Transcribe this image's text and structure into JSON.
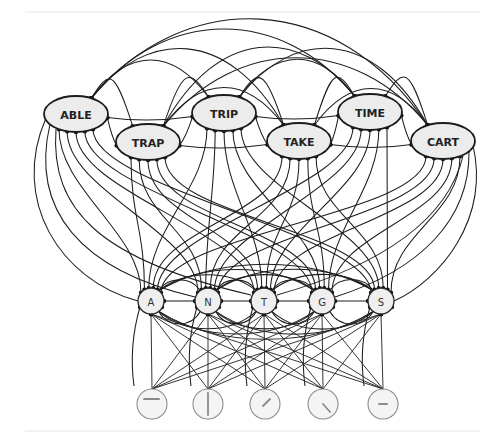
{
  "diagram": {
    "type": "interactive-activation-network",
    "layers": {
      "word": {
        "nodes": [
          {
            "id": "ABLE",
            "label": "ABLE",
            "cx": 76,
            "cy": 114
          },
          {
            "id": "TRAP",
            "label": "TRAP",
            "cx": 148,
            "cy": 142
          },
          {
            "id": "TRIP",
            "label": "TRIP",
            "cx": 224,
            "cy": 113
          },
          {
            "id": "TAKE",
            "label": "TAKE",
            "cx": 299,
            "cy": 141
          },
          {
            "id": "TIME",
            "label": "TIME",
            "cx": 370,
            "cy": 112
          },
          {
            "id": "CART",
            "label": "CART",
            "cx": 443,
            "cy": 141
          }
        ]
      },
      "letter": {
        "nodes": [
          {
            "id": "A",
            "label": "A",
            "cx": 151,
            "cy": 301
          },
          {
            "id": "N",
            "label": "N",
            "cx": 208,
            "cy": 301
          },
          {
            "id": "T",
            "label": "T",
            "cx": 264,
            "cy": 301
          },
          {
            "id": "G",
            "label": "G",
            "cx": 322,
            "cy": 301
          },
          {
            "id": "S",
            "label": "S",
            "cx": 381,
            "cy": 301
          }
        ]
      },
      "feature": {
        "nodes": [
          {
            "id": "horizontal-top",
            "glyph": "horizontal bar (upper)",
            "cx": 152,
            "cy": 404
          },
          {
            "id": "vertical",
            "glyph": "vertical bar",
            "cx": 208,
            "cy": 404
          },
          {
            "id": "diagonal-right",
            "glyph": "diagonal bar (up-right)",
            "cx": 265,
            "cy": 404
          },
          {
            "id": "diagonal-left",
            "glyph": "diagonal bar (down-right)",
            "cx": 323,
            "cy": 404
          },
          {
            "id": "horizontal-mid",
            "glyph": "horizontal bar (middle)",
            "cx": 383,
            "cy": 404
          }
        ]
      }
    },
    "connections": {
      "word_to_word": "mutual inhibitory arcs among all word nodes (dot terminals)",
      "letter_to_word": "excitatory/inhibitory arrows between every letter node and every word node",
      "letter_to_letter": "mutual arcs among letter nodes",
      "feature_to_letter": "straight lines from every feature node to every letter node"
    },
    "colors": {
      "edge": "#1e1e1e",
      "node_fill": "#ececec",
      "node_stroke": "#1c1c1c",
      "feature_stroke": "#8c8c8c",
      "rule": "#e6e6e6"
    }
  }
}
